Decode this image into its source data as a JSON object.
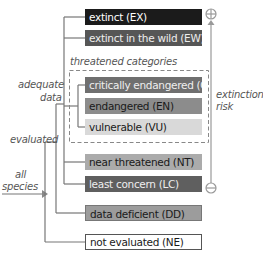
{
  "categories": [
    {
      "code": "EX",
      "label": "extinct (EX)",
      "color": "#1b1b1b",
      "text_color": "#ffffff"
    },
    {
      "code": "EW",
      "label": "extinct in the wild (EW)",
      "color": "#565656",
      "text_color": "#f0f0f0"
    },
    {
      "code": "CR",
      "label": "critically endangered (CR)",
      "color": "#6f6f6f",
      "text_color": "#f0f0f0"
    },
    {
      "code": "EN",
      "label": "endangered (EN)",
      "color": "#8c8c8c",
      "text_color": "#1a1a1a"
    },
    {
      "code": "VU",
      "label": "vulnerable (VU)",
      "color": "#d9d9d9",
      "text_color": "#1a1a1a"
    },
    {
      "code": "NT",
      "label": "near threatened (NT)",
      "color": "#ababab",
      "text_color": "#1a1a1a"
    },
    {
      "code": "LC",
      "label": "least concern (LC)",
      "color": "#5f5f5f",
      "text_color": "#f0f0f0"
    },
    {
      "code": "DD",
      "label": "data deficient (DD)",
      "color": "#9c9c9c",
      "text_color": "#1a1a1a"
    },
    {
      "code": "NE",
      "label": "not evaluated (NE)",
      "color": "#ffffff",
      "text_color": "#1a1a1a"
    }
  ],
  "group_labels": {
    "threatened": "threatened categories",
    "adequate_data_1": "adequate",
    "adequate_data_2": "data",
    "evaluated": "evaluated",
    "all_species_1": "all",
    "all_species_2": "species",
    "extinction_risk_1": "extinction",
    "extinction_risk_2": "risk"
  },
  "risk_axis": {
    "high_symbol": "+",
    "low_symbol": "−"
  }
}
